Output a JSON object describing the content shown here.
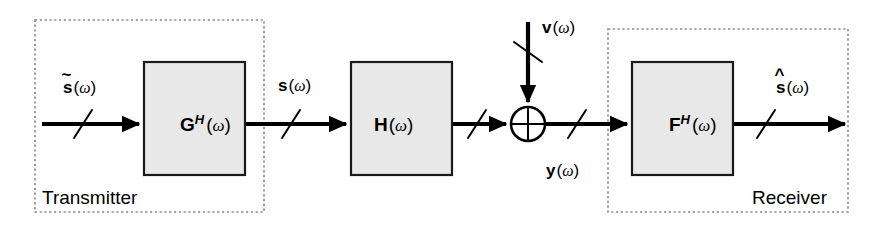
{
  "diagram": {
    "background_color": "#ffffff",
    "line_color": "#000000",
    "block_fill": "#e8e8e8",
    "block_stroke": "#1a1a1a",
    "group_stroke": "#8a8a8a"
  },
  "groups": [
    {
      "id": "transmitter",
      "label": "Transmitter",
      "x": 35,
      "y": 20,
      "w": 229,
      "h": 192
    },
    {
      "id": "receiver",
      "label": "Receiver",
      "x": 608,
      "y": 29,
      "w": 240,
      "h": 183
    }
  ],
  "blocks": [
    {
      "id": "precoder",
      "base": "G",
      "superscript": "H",
      "arg_open": "(",
      "arg": "ω",
      "arg_close": ")",
      "full_label": "G^H(ω)",
      "x": 144,
      "y": 62,
      "w": 101,
      "h": 113
    },
    {
      "id": "channel",
      "base": "H",
      "superscript": "",
      "arg_open": "(",
      "arg": "ω",
      "arg_close": ")",
      "full_label": "H(ω)",
      "x": 351,
      "y": 62,
      "w": 101,
      "h": 113
    },
    {
      "id": "equalizer",
      "base": "F",
      "superscript": "H",
      "arg_open": "(",
      "arg": "ω",
      "arg_close": ")",
      "full_label": "F^H(ω)",
      "x": 632,
      "y": 62,
      "w": 101,
      "h": 113
    }
  ],
  "summer": {
    "id": "adder",
    "cx": 528,
    "cy": 124,
    "r": 17,
    "symbol": "cross"
  },
  "signals": [
    {
      "id": "s-tilde",
      "accent": "̃",
      "base": "s",
      "arg_open": "(",
      "arg": "ω",
      "arg_close": ")",
      "full_label": "s̃(ω)",
      "label_x": 63,
      "label_y": 93,
      "description": "transmitter input symbol vector"
    },
    {
      "id": "s",
      "accent": "",
      "base": "s",
      "arg_open": "(",
      "arg": "ω",
      "arg_close": ")",
      "full_label": "s(ω)",
      "label_x": 278,
      "label_y": 91,
      "description": "precoded transmit vector"
    },
    {
      "id": "v",
      "accent": "",
      "base": "v",
      "arg_open": "(",
      "arg": "ω",
      "arg_close": ")",
      "full_label": "v(ω)",
      "label_x": 542,
      "label_y": 33,
      "description": "additive noise vector"
    },
    {
      "id": "y",
      "accent": "",
      "base": "y",
      "arg_open": "(",
      "arg": "ω",
      "arg_close": ")",
      "full_label": "y(ω)",
      "label_x": 546,
      "label_y": 176,
      "description": "received vector"
    },
    {
      "id": "s-hat",
      "accent": "̂",
      "base": "s",
      "arg_open": "(",
      "arg": "ω",
      "arg_close": ")",
      "full_label": "ŝ(ω)",
      "label_x": 776,
      "label_y": 93,
      "description": "estimated symbol vector"
    }
  ],
  "bus_slashes": [
    {
      "id": "slash-input",
      "cx": 83,
      "cy": 124
    },
    {
      "id": "slash-s",
      "cx": 291,
      "cy": 124
    },
    {
      "id": "slash-h-out",
      "cx": 477,
      "cy": 124
    },
    {
      "id": "slash-v",
      "cx": 528,
      "cy": 52
    },
    {
      "id": "slash-y",
      "cx": 577,
      "cy": 124
    },
    {
      "id": "slash-out",
      "cx": 766,
      "cy": 124
    }
  ]
}
